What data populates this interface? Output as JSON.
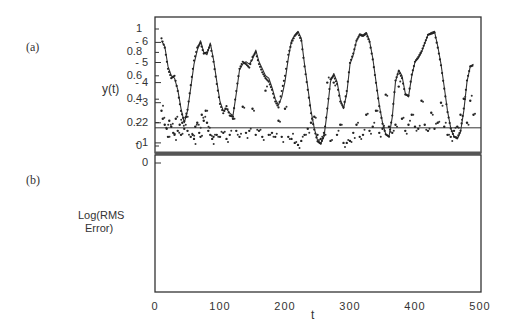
{
  "panels": {
    "a": {
      "label": "(a)",
      "ylabel": "y(t)",
      "yticks": [
        "1",
        "0.8",
        "0.6",
        "0.4",
        "0.2",
        "0"
      ]
    },
    "b": {
      "label": "(b)",
      "ylabel_line1": "Log(RMS",
      "ylabel_line2": "Error)",
      "yticks": [
        "0",
        "- 1",
        "- 2",
        "- 3",
        "- 4",
        "- 5",
        "- 6"
      ]
    }
  },
  "xaxis": {
    "label": "t",
    "ticks": [
      "0",
      "100",
      "200",
      "300",
      "400",
      "500"
    ]
  },
  "chart_data": [
    {
      "type": "line",
      "title": "(a)",
      "xlabel": "",
      "ylabel": "y(t)",
      "xlim": [
        0,
        500
      ],
      "ylim": [
        -0.05,
        1.05
      ],
      "grid": false,
      "series": [
        {
          "name": "actual (solid line)",
          "x": [
            10,
            15,
            20,
            25,
            30,
            35,
            40,
            45,
            50,
            55,
            60,
            65,
            70,
            75,
            80,
            85,
            90,
            95,
            100,
            105,
            110,
            115,
            120,
            125,
            130,
            135,
            140,
            145,
            150,
            155,
            160,
            165,
            170,
            175,
            180,
            185,
            190,
            195,
            200,
            205,
            210,
            215,
            220,
            225,
            230,
            235,
            240,
            245,
            250,
            255,
            260,
            265,
            270,
            275,
            280,
            285,
            290,
            295,
            300,
            305,
            310,
            315,
            320,
            325,
            330,
            335,
            340,
            345,
            350,
            355,
            360,
            365,
            370,
            375,
            380,
            385,
            390,
            395,
            400,
            405,
            410,
            415,
            420,
            425,
            430,
            435,
            440,
            445,
            450,
            455,
            460,
            465,
            470,
            475,
            480,
            485,
            490
          ],
          "y": [
            0.9,
            0.85,
            0.68,
            0.6,
            0.58,
            0.48,
            0.32,
            0.2,
            0.3,
            0.5,
            0.7,
            0.82,
            0.9,
            0.8,
            0.78,
            0.88,
            0.74,
            0.55,
            0.38,
            0.3,
            0.32,
            0.28,
            0.26,
            0.45,
            0.65,
            0.7,
            0.72,
            0.7,
            0.74,
            0.82,
            0.72,
            0.66,
            0.6,
            0.58,
            0.5,
            0.4,
            0.35,
            0.42,
            0.55,
            0.75,
            0.9,
            0.95,
            0.98,
            0.92,
            0.7,
            0.5,
            0.3,
            0.15,
            0.05,
            0.02,
            0.08,
            0.3,
            0.55,
            0.62,
            0.55,
            0.4,
            0.32,
            0.45,
            0.7,
            0.78,
            0.9,
            0.96,
            0.95,
            0.97,
            0.9,
            0.75,
            0.55,
            0.35,
            0.2,
            0.1,
            0.08,
            0.25,
            0.55,
            0.65,
            0.6,
            0.45,
            0.42,
            0.6,
            0.72,
            0.75,
            0.8,
            0.88,
            0.95,
            0.97,
            0.98,
            0.85,
            0.7,
            0.5,
            0.3,
            0.15,
            0.08,
            0.06,
            0.12,
            0.3,
            0.55,
            0.68,
            0.7
          ]
        },
        {
          "name": "predicted (dots)",
          "x": [
            10,
            15,
            20,
            25,
            30,
            35,
            40,
            45,
            50,
            55,
            60,
            65,
            70,
            75,
            80,
            85,
            90,
            95,
            100,
            105,
            110,
            115,
            120,
            125,
            130,
            135,
            140,
            145,
            150,
            155,
            160,
            165,
            170,
            175,
            180,
            185,
            190,
            195,
            200,
            205,
            210,
            215,
            220,
            225,
            230,
            235,
            240,
            245,
            250,
            255,
            260,
            265,
            270,
            275,
            280,
            285,
            290,
            295,
            300,
            305,
            310,
            315,
            320,
            325,
            330,
            335,
            340,
            345,
            350,
            355,
            360,
            365,
            370,
            375,
            380,
            385,
            390,
            395,
            400,
            405,
            410,
            415,
            420,
            425,
            430,
            435,
            440,
            445,
            450,
            455,
            460,
            465,
            470,
            475,
            480,
            485,
            490
          ],
          "y": [
            0.92,
            0.84,
            0.66,
            0.58,
            0.6,
            0.47,
            0.3,
            0.21,
            0.31,
            0.52,
            0.73,
            0.84,
            0.88,
            0.79,
            0.8,
            0.86,
            0.72,
            0.53,
            0.36,
            0.28,
            0.34,
            0.26,
            0.25,
            0.47,
            0.66,
            0.72,
            0.7,
            0.67,
            0.76,
            0.8,
            0.7,
            0.63,
            0.58,
            0.55,
            0.48,
            0.38,
            0.33,
            0.47,
            0.6,
            0.78,
            0.88,
            0.94,
            0.97,
            0.9,
            0.68,
            0.48,
            0.28,
            0.14,
            0.04,
            0.02,
            0.09,
            0.32,
            0.57,
            0.6,
            0.53,
            0.38,
            0.33,
            0.47,
            0.71,
            0.79,
            0.9,
            0.95,
            0.94,
            0.96,
            0.89,
            0.74,
            0.54,
            0.34,
            0.19,
            0.1,
            0.08,
            0.26,
            0.56,
            0.64,
            0.58,
            0.44,
            0.43,
            0.61,
            0.72,
            0.76,
            0.81,
            0.88,
            0.95,
            0.96,
            0.97,
            0.84,
            0.69,
            0.49,
            0.29,
            0.15,
            0.08,
            0.07,
            0.13,
            0.32,
            0.56,
            0.68,
            0.69
          ]
        }
      ]
    },
    {
      "type": "scatter",
      "title": "(b)",
      "xlabel": "t",
      "ylabel": "Log(RMS Error)",
      "xlim": [
        0,
        500
      ],
      "ylim": [
        -6.4,
        0.5
      ],
      "grid": false,
      "reference_line": {
        "y": -1.75,
        "orientation": "horizontal"
      },
      "series": [
        {
          "name": "log RMS error",
          "x": [
            10,
            12,
            15,
            18,
            20,
            22,
            25,
            28,
            30,
            32,
            35,
            38,
            40,
            42,
            45,
            48,
            50,
            55,
            58,
            60,
            62,
            65,
            68,
            70,
            72,
            75,
            78,
            80,
            82,
            85,
            88,
            90,
            95,
            100,
            105,
            110,
            115,
            120,
            125,
            130,
            135,
            140,
            145,
            150,
            155,
            160,
            165,
            170,
            175,
            180,
            185,
            190,
            195,
            200,
            205,
            210,
            215,
            220,
            225,
            230,
            235,
            240,
            245,
            250,
            255,
            260,
            265,
            270,
            275,
            280,
            285,
            290,
            295,
            300,
            305,
            310,
            315,
            320,
            325,
            330,
            335,
            340,
            345,
            350,
            355,
            360,
            365,
            370,
            375,
            380,
            385,
            390,
            395,
            400,
            405,
            410,
            415,
            420,
            425,
            430,
            435,
            440,
            445,
            450,
            455,
            460,
            465,
            470,
            475,
            480,
            485,
            490
          ],
          "y": [
            -2.6,
            -2.2,
            -1.9,
            -1.7,
            -1.3,
            -2.1,
            -1.8,
            -1.5,
            -1.4,
            -2.2,
            -1.6,
            -1.9,
            -1.4,
            -2.0,
            -1.7,
            -2.3,
            -1.6,
            -1.3,
            -1.4,
            -1.2,
            -1.8,
            -2.0,
            -1.5,
            -1.3,
            -2.4,
            -2.1,
            -2.6,
            -2.0,
            -1.6,
            -1.4,
            -1.2,
            -1.3,
            -1.4,
            -1.3,
            -1.5,
            -1.2,
            -1.4,
            -2.2,
            -1.6,
            -1.3,
            -2.8,
            -1.5,
            -1.6,
            -2.7,
            -1.4,
            -1.6,
            -1.3,
            -3.6,
            -1.4,
            -1.5,
            -1.3,
            -2.1,
            -1.3,
            -2.7,
            -1.3,
            -1.2,
            -1.0,
            -0.9,
            -1.1,
            -1.4,
            -1.7,
            -2.0,
            -2.3,
            -1.4,
            -1.2,
            -1.5,
            -4.0,
            -1.1,
            -4.0,
            -1.4,
            -1.9,
            -1.0,
            -1.0,
            -1.1,
            -1.5,
            -1.9,
            -1.3,
            -1.4,
            -2.4,
            -1.6,
            -1.8,
            -2.6,
            -1.5,
            -1.7,
            -3.4,
            -1.8,
            -1.5,
            -1.9,
            -3.8,
            -2.2,
            -1.6,
            -1.9,
            -2.4,
            -1.8,
            -1.7,
            -3.1,
            -1.9,
            -1.6,
            -2.5,
            -1.7,
            -2.0,
            -3.0,
            -1.8,
            -1.4,
            -1.3,
            -1.6,
            -1.8,
            -2.4,
            -3.2,
            -2.0,
            -3.1,
            -2.4
          ]
        }
      ]
    }
  ]
}
